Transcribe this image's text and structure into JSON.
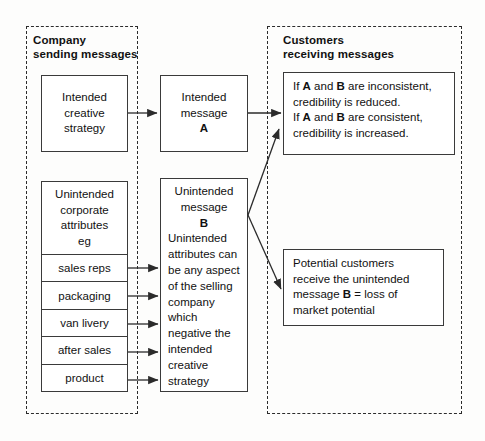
{
  "diagram": {
    "groups": {
      "company": {
        "title": "Company\nsending messages"
      },
      "customers": {
        "title": "Customers\nreceiving messages"
      }
    },
    "nodes": {
      "intended_strategy": {
        "text": "Intended\ncreative\nstrategy"
      },
      "intended_message": {
        "text_lines": "Intended\nmessage",
        "label": "A"
      },
      "credibility": {
        "line1_a": "If ",
        "line1_b": "A",
        "line1_c": " and ",
        "line1_d": "B",
        "line1_e": " are inconsistent,",
        "line2": "credibility is reduced.",
        "line3_a": "If ",
        "line3_b": "A",
        "line3_c": " and ",
        "line3_d": "B",
        "line3_e": " are consistent,",
        "line4": "credibility is increased."
      },
      "unintended_attributes": {
        "head": "Unintended\ncorporate\nattributes\neg",
        "rows": [
          "sales reps",
          "packaging",
          "van livery",
          "after sales",
          "product"
        ]
      },
      "unintended_message": {
        "head_lines": "Unintended\nmessage",
        "label": "B",
        "body": "Unintended\nattributes can\nbe any aspect\nof the selling\ncompany\nwhich\nnegative the\nintended\ncreative\nstrategy"
      },
      "potential_customers": {
        "line1": "Potential customers",
        "line2": "receive the unintended",
        "line3_a": "message ",
        "line3_b": "B",
        "line3_c": " = loss of",
        "line4": "market potential"
      }
    },
    "colors": {
      "stroke": "#3a3a3a",
      "dashed_stroke": "#2b2b2b",
      "text": "#111111",
      "background": "#fdfdfc"
    }
  }
}
